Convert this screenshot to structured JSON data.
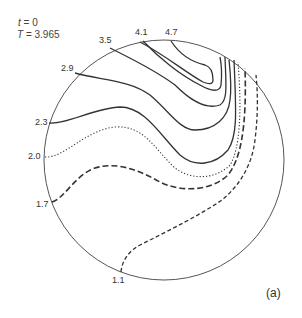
{
  "header": {
    "t_label": "t",
    "t_value": "= 0",
    "T_label": "T",
    "T_value": "= 3.965"
  },
  "panel_label": "(a)",
  "contours": [
    {
      "value": "4.7",
      "style": "solid"
    },
    {
      "value": "4.1",
      "style": "solid"
    },
    {
      "value": "3.5",
      "style": "solid"
    },
    {
      "value": "2.9",
      "style": "solid"
    },
    {
      "value": "2.3",
      "style": "solid"
    },
    {
      "value": "2.0",
      "style": "dotted"
    },
    {
      "value": "1.7",
      "style": "dashed"
    },
    {
      "value": "1.1",
      "style": "short-dashed"
    }
  ],
  "colors": {
    "line": "#333333",
    "circle": "#555555",
    "background": "#ffffff"
  }
}
